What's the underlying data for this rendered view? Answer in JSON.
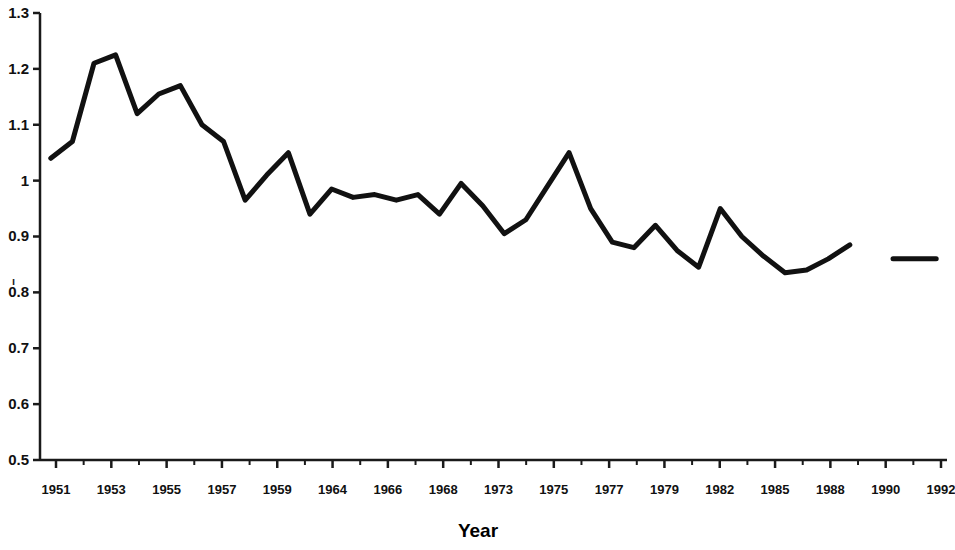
{
  "chart_data": {
    "type": "line",
    "title": "",
    "xlabel": "Year",
    "ylabel": "",
    "xlim": [
      1950.5,
      1992.5
    ],
    "ylim": [
      0.5,
      1.3
    ],
    "grid": false,
    "legend": "none",
    "y_ticks": [
      "1.3",
      "1.2",
      "1.1",
      "1",
      "0.9",
      "0.8",
      "0.7",
      "0.6",
      "0.5"
    ],
    "y_tick_values": [
      1.3,
      1.2,
      1.1,
      1.0,
      0.9,
      0.8,
      0.7,
      0.6,
      0.5
    ],
    "x_tick_labels": [
      "1951",
      "1953",
      "1955",
      "1957",
      "1959",
      "1964",
      "1966",
      "1968",
      "1973",
      "1975",
      "1977",
      "1979",
      "1982",
      "1985",
      "1988",
      "1990",
      "1992"
    ],
    "series": [
      {
        "name": "main",
        "x": [
          1951,
          1952,
          1953,
          1954,
          1955,
          1956,
          1957,
          1958,
          1959,
          1960,
          1961,
          1962,
          1963,
          1964,
          1965,
          1966,
          1967,
          1968,
          1969,
          1970,
          1971,
          1972,
          1973,
          1974,
          1975,
          1976,
          1977,
          1978,
          1979,
          1980,
          1981,
          1982,
          1983,
          1984,
          1985,
          1986,
          1987,
          1988
        ],
        "values": [
          1.04,
          1.07,
          1.21,
          1.225,
          1.12,
          1.155,
          1.17,
          1.1,
          1.07,
          0.965,
          1.01,
          1.05,
          0.94,
          0.985,
          0.97,
          0.975,
          0.965,
          0.975,
          0.94,
          0.995,
          0.955,
          0.905,
          0.93,
          0.99,
          1.05,
          0.95,
          0.89,
          0.88,
          0.92,
          0.875,
          0.845,
          0.95,
          0.9,
          0.865,
          0.835,
          0.84,
          0.86,
          0.885
        ]
      },
      {
        "name": "detached-segment",
        "x": [
          1990,
          1992
        ],
        "values": [
          0.86,
          0.86
        ]
      }
    ],
    "line_color": "#111111",
    "line_width": 5,
    "axis_color": "#1a1a1a",
    "stray_mark": "ı"
  }
}
